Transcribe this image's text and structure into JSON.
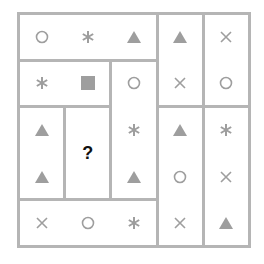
{
  "puzzle": {
    "columns": 5,
    "rows": 5,
    "colors": {
      "border": "#b5b5b5",
      "symbol": "#9e9e9e",
      "question": "#111111"
    },
    "regions": [
      {
        "id": "r0-h",
        "row": 0,
        "col": 0,
        "rowspan": 1,
        "colspan": 3
      },
      {
        "id": "c3-top",
        "row": 0,
        "col": 3,
        "rowspan": 2,
        "colspan": 1
      },
      {
        "id": "c4-top",
        "row": 0,
        "col": 4,
        "rowspan": 2,
        "colspan": 1
      },
      {
        "id": "r1-h",
        "row": 1,
        "col": 0,
        "rowspan": 1,
        "colspan": 2
      },
      {
        "id": "c2-mid",
        "row": 1,
        "col": 2,
        "rowspan": 3,
        "colspan": 1
      },
      {
        "id": "c0-mid",
        "row": 2,
        "col": 0,
        "rowspan": 2,
        "colspan": 1
      },
      {
        "id": "c1-mid",
        "row": 2,
        "col": 1,
        "rowspan": 2,
        "colspan": 1
      },
      {
        "id": "c3-bot",
        "row": 2,
        "col": 3,
        "rowspan": 3,
        "colspan": 1
      },
      {
        "id": "c4-bot",
        "row": 2,
        "col": 4,
        "rowspan": 3,
        "colspan": 1
      },
      {
        "id": "r4-h",
        "row": 4,
        "col": 0,
        "rowspan": 1,
        "colspan": 3
      }
    ],
    "cells": [
      {
        "row": 0,
        "col": 0,
        "symbol": "circle"
      },
      {
        "row": 0,
        "col": 1,
        "symbol": "asterisk"
      },
      {
        "row": 0,
        "col": 2,
        "symbol": "triangle"
      },
      {
        "row": 0,
        "col": 3,
        "symbol": "triangle"
      },
      {
        "row": 0,
        "col": 4,
        "symbol": "cross"
      },
      {
        "row": 1,
        "col": 0,
        "symbol": "asterisk"
      },
      {
        "row": 1,
        "col": 1,
        "symbol": "square"
      },
      {
        "row": 1,
        "col": 2,
        "symbol": "circle"
      },
      {
        "row": 1,
        "col": 3,
        "symbol": "cross"
      },
      {
        "row": 1,
        "col": 4,
        "symbol": "circle"
      },
      {
        "row": 2,
        "col": 0,
        "symbol": "triangle"
      },
      {
        "row": 2,
        "col": 2,
        "symbol": "asterisk"
      },
      {
        "row": 2,
        "col": 3,
        "symbol": "triangle"
      },
      {
        "row": 2,
        "col": 4,
        "symbol": "asterisk"
      },
      {
        "row": 3,
        "col": 0,
        "symbol": "triangle"
      },
      {
        "row": 3,
        "col": 2,
        "symbol": "triangle"
      },
      {
        "row": 3,
        "col": 3,
        "symbol": "circle"
      },
      {
        "row": 3,
        "col": 4,
        "symbol": "cross"
      },
      {
        "row": 4,
        "col": 0,
        "symbol": "cross"
      },
      {
        "row": 4,
        "col": 1,
        "symbol": "circle"
      },
      {
        "row": 4,
        "col": 2,
        "symbol": "asterisk"
      },
      {
        "row": 4,
        "col": 3,
        "symbol": "cross"
      },
      {
        "row": 4,
        "col": 4,
        "symbol": "triangle"
      }
    ],
    "question": {
      "row": 2,
      "col": 1,
      "rowspan": 2,
      "label": "?"
    }
  }
}
